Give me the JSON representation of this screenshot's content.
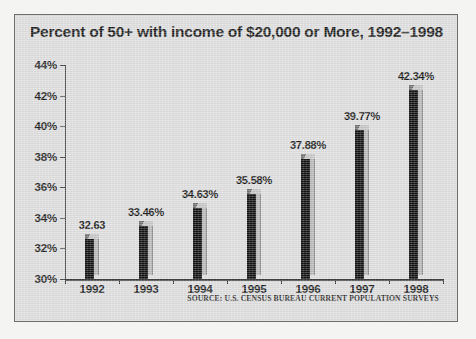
{
  "chart_data": {
    "type": "bar",
    "title": "Percent of 50+ with income of $20,000 or More, 1992–1998",
    "xlabel": "",
    "ylabel": "",
    "categories": [
      "1992",
      "1993",
      "1994",
      "1995",
      "1996",
      "1997",
      "1998"
    ],
    "values": [
      32.63,
      33.46,
      34.63,
      35.58,
      37.88,
      39.77,
      42.34
    ],
    "data_labels": [
      "32.63",
      "33.46%",
      "34.63%",
      "35.58%",
      "37.88%",
      "39.77%",
      "42.34%"
    ],
    "ylim": [
      30,
      44
    ],
    "y_ticks": [
      30,
      32,
      34,
      36,
      38,
      40,
      42,
      44
    ],
    "y_tick_labels": [
      "30%",
      "32%",
      "34%",
      "36%",
      "38%",
      "40%",
      "42%",
      "44%"
    ],
    "grid": false,
    "legend": false,
    "legend_position": "none",
    "annotations": [
      "SOURCE: U.S. CENSUS BUREAU CURRENT POPULATION SURVEYS"
    ],
    "colors": {
      "bar_front": "#111111",
      "bar_side": "#b9b9b9",
      "bar_top": "#a9a9a9",
      "plot_background": "#dedede",
      "panel_border": "#6e6e6e",
      "axis": "#3a3a3a",
      "text": "#1b1b1b",
      "figure_background": "#f4f4f2"
    }
  },
  "source_note": "SOURCE: U.S. CENSUS BUREAU CURRENT POPULATION SURVEYS"
}
